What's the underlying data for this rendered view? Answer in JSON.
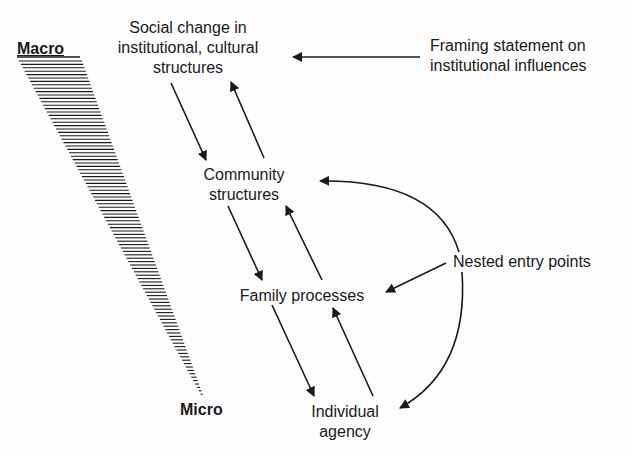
{
  "diagram": {
    "scale": {
      "top_label": "Macro",
      "bottom_label": "Micro"
    },
    "nodes": {
      "social": {
        "lines": [
          "Social change in",
          "institutional, cultural",
          "structures"
        ]
      },
      "community": {
        "lines": [
          "Community",
          "structures"
        ]
      },
      "family": {
        "lines": [
          "Family processes"
        ]
      },
      "individual": {
        "lines": [
          "Individual",
          "agency"
        ]
      }
    },
    "annotations": {
      "framing": {
        "lines": [
          "Framing statement on",
          "institutional influences"
        ]
      },
      "nested": {
        "lines": [
          "Nested entry points"
        ]
      }
    },
    "edges": [
      {
        "from": "social",
        "to": "community",
        "direction": "down"
      },
      {
        "from": "community",
        "to": "social",
        "direction": "up"
      },
      {
        "from": "community",
        "to": "family",
        "direction": "down"
      },
      {
        "from": "family",
        "to": "community",
        "direction": "up"
      },
      {
        "from": "family",
        "to": "individual",
        "direction": "down"
      },
      {
        "from": "individual",
        "to": "family",
        "direction": "up"
      },
      {
        "from": "framing",
        "to": "social"
      },
      {
        "from": "nested",
        "to": "community"
      },
      {
        "from": "nested",
        "to": "family"
      },
      {
        "from": "nested",
        "to": "individual"
      }
    ],
    "colors": {
      "ink": "#1a1a1a",
      "background": "#fdfdfd"
    }
  }
}
